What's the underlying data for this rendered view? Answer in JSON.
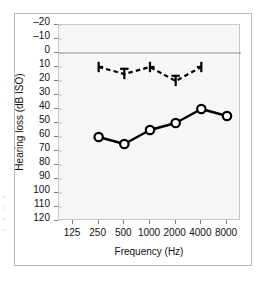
{
  "chart_data": {
    "type": "line",
    "title": "",
    "xlabel": "Frequency (Hz)",
    "ylabel": "Hearing loss (dB ISO)",
    "x": [
      125,
      250,
      500,
      1000,
      2000,
      4000,
      8000
    ],
    "x_tick_labels": [
      "125",
      "250",
      "500",
      "1000",
      "2000",
      "4000",
      "8000"
    ],
    "x_scale": "log2-steps",
    "y_tick_labels": [
      "–20",
      "–10",
      "0",
      "10",
      "20",
      "30",
      "40",
      "50",
      "60",
      "70",
      "80",
      "90",
      "100",
      "110",
      "120"
    ],
    "y_ticks": [
      -20,
      -10,
      0,
      10,
      20,
      30,
      40,
      50,
      60,
      70,
      80,
      90,
      100,
      110,
      120
    ],
    "ylim": [
      -20,
      120
    ],
    "y_inverted": true,
    "grid": false,
    "reference_line_y": 0,
    "legend": "none",
    "series": [
      {
        "name": "Bone conduction (masked)",
        "marker": "bone-bracket",
        "linestyle": "dashed",
        "color": "#000000",
        "x": [
          250,
          500,
          1000,
          2000,
          4000
        ],
        "values": [
          10,
          15,
          10,
          20,
          10
        ]
      },
      {
        "name": "Air conduction (right ear)",
        "marker": "open-circle",
        "linestyle": "solid",
        "color": "#000000",
        "x": [
          250,
          500,
          1000,
          2000,
          4000,
          8000
        ],
        "values": [
          60,
          65,
          55,
          50,
          40,
          45
        ]
      }
    ]
  },
  "axes": {
    "y_title": "Hearing loss (dB ISO)",
    "x_title": "Frequency (Hz)"
  },
  "colors": {
    "plot_background": "#f7f7f7",
    "figure_background": "#ffffff",
    "axis_line": "#7a7a7a",
    "plot_border": "#c8c8c8",
    "figure_border": "#b9b9b9",
    "data": "#000000"
  }
}
